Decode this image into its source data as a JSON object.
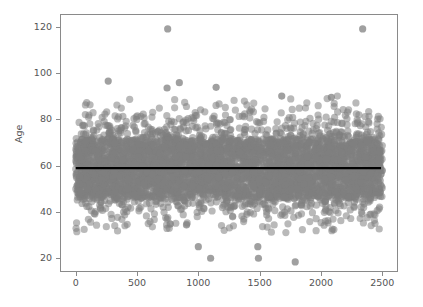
{
  "chart_data": {
    "type": "scatter",
    "title": "",
    "xlabel": "",
    "ylabel": "Age",
    "xlim": [
      -120,
      2620
    ],
    "ylim": [
      14.5,
      125
    ],
    "grid": false,
    "legend": null,
    "xticks": [
      0,
      500,
      1000,
      1500,
      2000,
      2500
    ],
    "xtick_labels": [
      "0",
      "500",
      "1000",
      "1500",
      "2000",
      "2500"
    ],
    "yticks": [
      20,
      40,
      60,
      80,
      100,
      120
    ],
    "ytick_labels": [
      "20",
      "40",
      "60",
      "80",
      "100",
      "120"
    ],
    "series": [
      {
        "name": "Age by observation index",
        "marker": "circle",
        "marker_size": 5,
        "color": "#808080",
        "opacity": 0.55,
        "n_points": 2500,
        "x_range": [
          0,
          2500
        ],
        "y_range": [
          18.4,
          119
        ],
        "description": "Dense horizontal band of ages with no trend across the observation index; core concentration between 46 and 72, sparse tails up to about 90 and down to about 31, plus isolated extreme points.",
        "distribution": {
          "mean": 58.8,
          "median": 59,
          "std": 11.5,
          "dense_band": [
            46,
            71.5
          ],
          "whisker_band": [
            31,
            90
          ]
        },
        "notable_points": [
          {
            "x": 750,
            "y": 119,
            "note": "high outlier"
          },
          {
            "x": 2340,
            "y": 119,
            "note": "high outlier"
          },
          {
            "x": 265,
            "y": 96.5,
            "note": "upper tail"
          },
          {
            "x": 845,
            "y": 95.8,
            "note": "upper tail"
          },
          {
            "x": 1145,
            "y": 93.8,
            "note": "upper tail"
          },
          {
            "x": 745,
            "y": 93.5,
            "note": "upper tail"
          },
          {
            "x": 2085,
            "y": 89.5,
            "note": "upper tail"
          },
          {
            "x": 1680,
            "y": 90,
            "note": "upper tail"
          },
          {
            "x": 1000,
            "y": 25,
            "note": "low outlier"
          },
          {
            "x": 1100,
            "y": 20,
            "note": "low outlier"
          },
          {
            "x": 1490,
            "y": 20,
            "note": "low outlier"
          },
          {
            "x": 1790,
            "y": 18.4,
            "note": "lowest point"
          },
          {
            "x": 1485,
            "y": 25,
            "note": "low outlier"
          }
        ]
      },
      {
        "name": "Fit line",
        "type": "line",
        "color": "#000000",
        "linewidth": 2.4,
        "y_value": 58.9,
        "x_from": 0,
        "x_to": 2490,
        "description": "Flat black horizontal regression line at Age = 58.9 indicating no relationship with the index."
      }
    ]
  }
}
